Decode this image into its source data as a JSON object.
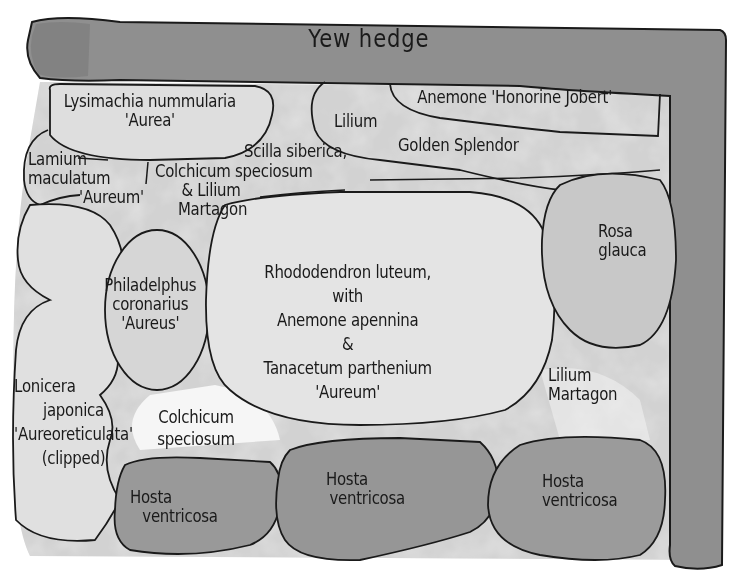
{
  "title": "Yew hedge",
  "colors": {
    "paper": "#ffffff",
    "hedge": "#8c8c8c",
    "bed_wash": "#cfcfcf",
    "light_wash": "#e6e6e6",
    "hosta": "#9a9a9a",
    "ink": "#1a1a1a"
  },
  "hedge": {
    "label": "Yew hedge"
  },
  "plants": {
    "lysimachia": {
      "line1": "Lysimachia nummularia",
      "line2": "'Aurea'"
    },
    "anemone_honorine": {
      "line1": "Anemone 'Honorine Jobert'"
    },
    "lilium_golden": {
      "line1": "Lilium",
      "line2": "Golden Splendor"
    },
    "lamium": {
      "line1": "Lamium",
      "line2": "maculatum",
      "line3": "'Aureum'"
    },
    "scilla": {
      "line1": "Scilla siberica,"
    },
    "colchicum_top": {
      "line1": "Colchicum speciosum",
      "line2": "& Lilium",
      "line3": "Martagon"
    },
    "rosa": {
      "line1": "Rosa",
      "line2": "glauca"
    },
    "philadelphus": {
      "line1": "Philadelphus",
      "line2": "coronarius",
      "line3": "'Aureus'"
    },
    "rhododendron": {
      "line1": "Rhododendron luteum,",
      "line2": "with",
      "line3": "Anemone apennina",
      "line4": "&",
      "line5": "Tanacetum parthenium",
      "line6": "'Aureum'"
    },
    "lilium_martagon": {
      "line1": "Lilium",
      "line2": "Martagon"
    },
    "lonicera": {
      "line1": "Lonicera",
      "line2": "japonica",
      "line3": "'Aureoreticulata'",
      "line4": "(clipped)"
    },
    "colchicum_bottom": {
      "line1": "Colchicum",
      "line2": "speciosum"
    },
    "hosta_left": {
      "line1": "Hosta",
      "line2": "ventricosa"
    },
    "hosta_middle": {
      "line1": "Hosta",
      "line2": "ventricosa"
    },
    "hosta_right": {
      "line1": "Hosta",
      "line2": "ventricosa"
    }
  }
}
